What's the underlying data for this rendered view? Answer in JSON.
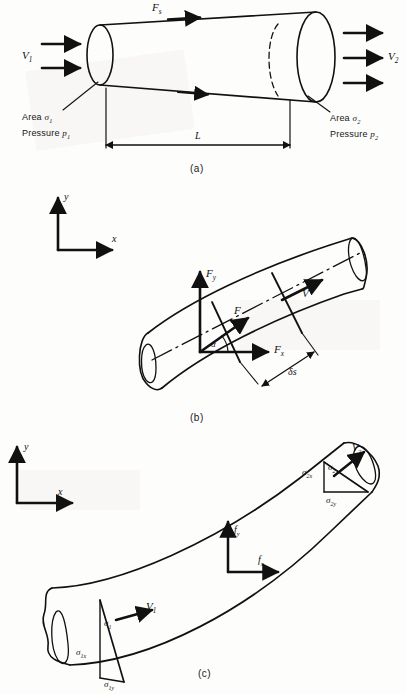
{
  "figure": {
    "ink_color": "#111111",
    "paper_color": "#fdfdfc",
    "panels": [
      {
        "id": "a",
        "caption": "(a)",
        "description": "Diverging stream tube with inlet and outlet flow arrows, surface force and length dimension",
        "labels": {
          "inlet_velocity": "V",
          "inlet_velocity_sub": "1",
          "outlet_velocity": "V",
          "outlet_velocity_sub": "2",
          "surface_force": "F",
          "surface_force_sub": "s",
          "length": "L",
          "area_1_prefix": "Area",
          "area_1_symbol": "σ",
          "area_1_sub": "1",
          "pressure_1_prefix": "Pressure",
          "pressure_1_symbol": "p",
          "pressure_1_sub": "1",
          "area_2_prefix": "Area",
          "area_2_symbol": "σ",
          "area_2_sub": "2",
          "pressure_2_prefix": "Pressure",
          "pressure_2_symbol": "p",
          "pressure_2_sub": "2"
        }
      },
      {
        "id": "b",
        "caption": "(b)",
        "description": "Curved stream tube element of length delta-s with resultant force F resolved into Fx and Fy at angle alpha to the velocity V",
        "labels": {
          "axis_x": "x",
          "axis_y": "y",
          "force_y": "F",
          "force_y_sub": "y",
          "force_x": "F",
          "force_x_sub": "x",
          "force_resultant": "F",
          "velocity": "V",
          "angle": "α",
          "element_length": "δs"
        }
      },
      {
        "id": "c",
        "caption": "(c)",
        "description": "Curved stream tube with inlet area sigma-1 and outlet area sigma-2 resolved into x and y projections, body force components fx and fy",
        "labels": {
          "axis_x": "x",
          "axis_y": "y",
          "body_force_y": "f",
          "body_force_y_sub": "y",
          "body_force_x": "f",
          "body_force_x_sub": "x",
          "inlet_velocity": "V",
          "inlet_velocity_sub": "1",
          "outlet_velocity": "V",
          "outlet_velocity_sub": "2",
          "area_1": "σ",
          "area_1_sub": "1",
          "area_1x": "σ",
          "area_1x_sub": "1x",
          "area_1y": "σ",
          "area_1y_sub": "1y",
          "area_2": "σ",
          "area_2_sub": "2",
          "area_2x": "σ",
          "area_2x_sub": "2x",
          "area_2y": "σ",
          "area_2y_sub": "2y"
        }
      }
    ]
  }
}
